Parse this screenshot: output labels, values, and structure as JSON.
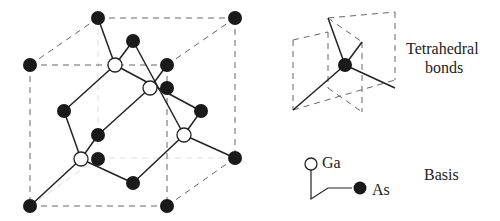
{
  "diagram": {
    "colors": {
      "as_atom": "#1a1a1a",
      "ga_atom": "#ffffff",
      "bond": "#222222",
      "cube_edge": "#666666"
    },
    "unit_cell": {
      "as_atoms": [
        [
          98,
          18
        ],
        [
          235,
          18
        ],
        [
          30,
          65
        ],
        [
          167,
          65
        ],
        [
          133,
          41
        ],
        [
          167,
          88
        ],
        [
          64,
          111
        ],
        [
          201,
          111
        ],
        [
          98,
          135
        ],
        [
          98,
          159
        ],
        [
          235,
          158
        ],
        [
          133,
          183
        ],
        [
          30,
          206
        ],
        [
          167,
          206
        ]
      ],
      "ga_atoms": [
        [
          115,
          65
        ],
        [
          150,
          88
        ],
        [
          184,
          135
        ],
        [
          81,
          159
        ]
      ]
    },
    "labels": {
      "tetrahedral_line1": "Tetrahedral",
      "tetrahedral_line2": "bonds",
      "ga": "Ga",
      "as": "As",
      "basis": "Basis"
    }
  }
}
